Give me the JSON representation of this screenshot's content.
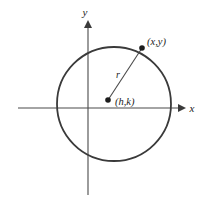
{
  "figure": {
    "background_color": "#ffffff",
    "stroke_color": "#3a3a3a",
    "axis_color": "#4a4a4a",
    "text_color": "#1c1c1c"
  },
  "axes": {
    "x_label": "x",
    "y_label": "y",
    "x_axis": {
      "x1": 18,
      "y1": 108,
      "x2": 182,
      "y2": 108,
      "arrow": "right"
    },
    "y_axis": {
      "x1": 88,
      "y1": 195,
      "x2": 88,
      "y2": 22,
      "arrow": "up"
    }
  },
  "circle": {
    "center_x": 114,
    "center_y": 104,
    "radius": 57,
    "stroke_width": 1.8
  },
  "center_point": {
    "x": 108,
    "y": 100,
    "label": "(h,k)",
    "label_x": 115,
    "label_y": 105,
    "dot_radius": 2.8
  },
  "circle_point": {
    "x": 142,
    "y": 48,
    "label": "(x,y)",
    "label_x": 147,
    "label_y": 45,
    "dot_radius": 2.8
  },
  "radius_segment": {
    "label": "r",
    "label_x": 118,
    "label_y": 77,
    "x1": 108,
    "y1": 100,
    "x2": 142,
    "y2": 48
  }
}
